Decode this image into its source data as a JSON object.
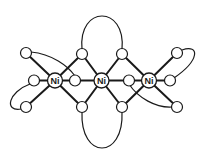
{
  "diagram": {
    "type": "molecular-structure",
    "metal_label": "Ni",
    "metals": [
      {
        "id": "ni1",
        "label": "Ni",
        "x": 55,
        "y": 80.5
      },
      {
        "id": "ni2",
        "label": "Ni",
        "x": 101.5,
        "y": 80.5
      },
      {
        "id": "ni3",
        "label": "Ni",
        "x": 149,
        "y": 80.5
      }
    ],
    "ligand_atoms": [
      {
        "id": "o_tl",
        "x": 26,
        "y": 53
      },
      {
        "id": "o_ml",
        "x": 34,
        "y": 80.5
      },
      {
        "id": "o_bl",
        "x": 26,
        "y": 107
      },
      {
        "id": "o_tb1",
        "x": 82,
        "y": 54
      },
      {
        "id": "o_tb2",
        "x": 122,
        "y": 54
      },
      {
        "id": "o_i1",
        "x": 75,
        "y": 80.5
      },
      {
        "id": "o_i2",
        "x": 129,
        "y": 80.5
      },
      {
        "id": "o_bb1",
        "x": 82,
        "y": 107
      },
      {
        "id": "o_bb2",
        "x": 122,
        "y": 107
      },
      {
        "id": "o_tr",
        "x": 177,
        "y": 53
      },
      {
        "id": "o_mr",
        "x": 170,
        "y": 80.5
      },
      {
        "id": "o_br",
        "x": 177,
        "y": 107
      }
    ],
    "colors": {
      "line": "#1a1a1a",
      "background": "#ffffff"
    }
  }
}
